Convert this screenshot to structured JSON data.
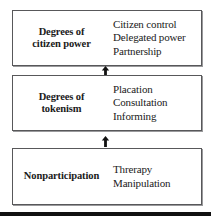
{
  "diagram": {
    "name": "ladder-of-citizen-participation",
    "tiers": [
      {
        "label_line1": "Degrees of",
        "label_line2": "citizen power",
        "rungs": [
          "Citizen control",
          "Delegated power",
          "Partnership"
        ]
      },
      {
        "label_line1": "Degrees of",
        "label_line2": "tokenism",
        "rungs": [
          "Placation",
          "Consultation",
          "Informing"
        ]
      },
      {
        "label_line1": "Nonparticipation",
        "label_line2": "",
        "rungs": [
          "Threrapy",
          "Manipulation"
        ]
      }
    ],
    "connectors": [
      {
        "icon": "up-arrow-icon"
      },
      {
        "icon": "up-arrow-icon"
      }
    ],
    "colors": {
      "box_border": "#58585a",
      "box_fill": "#ffffff",
      "text": "#1a1a1a",
      "arrow": "#111111",
      "bottom_rule": "#111111"
    }
  }
}
